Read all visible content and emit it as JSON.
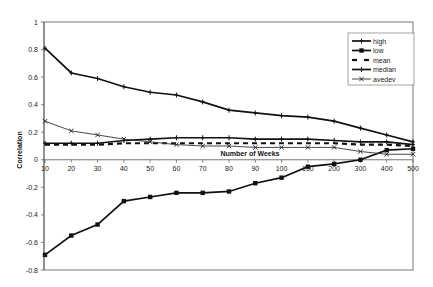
{
  "chart_data": {
    "type": "line",
    "title": "",
    "xlabel": "Number of Weeks",
    "ylabel": "Correlation",
    "ylim": [
      -0.8,
      1
    ],
    "yticks": [
      1,
      0.8,
      0.6,
      0.4,
      0.2,
      0,
      -0.2,
      -0.4,
      -0.6,
      -0.8
    ],
    "ytick_labels": [
      "1",
      "0.8",
      "0.6",
      "0.4",
      "0.2",
      "0",
      "-0.2",
      "-0.4",
      "-0.6",
      "-0.8"
    ],
    "grid": false,
    "legend_position": "upper right",
    "categories": [
      "10",
      "20",
      "30",
      "40",
      "50",
      "60",
      "70",
      "80",
      "90",
      "100",
      "150",
      "200",
      "300",
      "400",
      "500"
    ],
    "series": [
      {
        "name": "high",
        "marker": "plus",
        "line": "solid-thick",
        "values": [
          0.81,
          0.63,
          0.59,
          0.53,
          0.49,
          0.47,
          0.42,
          0.36,
          0.34,
          0.32,
          0.31,
          0.28,
          0.23,
          0.18,
          0.13
        ]
      },
      {
        "name": "low",
        "marker": "square",
        "line": "solid-thick",
        "values": [
          -0.69,
          -0.55,
          -0.47,
          -0.3,
          -0.27,
          -0.24,
          -0.24,
          -0.23,
          -0.17,
          -0.13,
          -0.05,
          -0.03,
          0.0,
          0.07,
          0.08
        ]
      },
      {
        "name": "mean",
        "marker": "none",
        "line": "dashed-thick",
        "values": [
          0.11,
          0.11,
          0.11,
          0.12,
          0.12,
          0.12,
          0.12,
          0.12,
          0.12,
          0.12,
          0.12,
          0.12,
          0.11,
          0.11,
          0.1
        ]
      },
      {
        "name": "median",
        "marker": "plus",
        "line": "solid-thick",
        "values": [
          0.12,
          0.12,
          0.12,
          0.14,
          0.15,
          0.16,
          0.16,
          0.16,
          0.15,
          0.15,
          0.15,
          0.14,
          0.13,
          0.13,
          0.11
        ]
      },
      {
        "name": "avedev",
        "marker": "x",
        "line": "solid-thin",
        "values": [
          0.28,
          0.21,
          0.18,
          0.15,
          0.13,
          0.11,
          0.1,
          0.1,
          0.09,
          0.09,
          0.09,
          0.09,
          0.06,
          0.04,
          0.04
        ]
      }
    ]
  },
  "legend": {
    "items": [
      "high",
      "low",
      "mean",
      "median",
      "avedev"
    ]
  },
  "axes": {
    "xlabel": "Number of Weeks",
    "ylabel": "Correlation"
  }
}
